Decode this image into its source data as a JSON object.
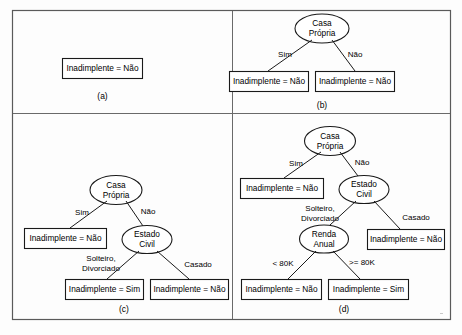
{
  "figure": {
    "caption_a": "(a)",
    "caption_b": "(b)",
    "caption_c": "(c)",
    "caption_d": "(d)",
    "colors": {
      "frame_stroke": "#5a5a5a",
      "node_stroke": "#1a1a1a",
      "node_fill": "#ffffff",
      "text": "#000000",
      "background": "#fdfdfd"
    }
  },
  "labels": {
    "inadimplente_nao": "Inadimplente = Não",
    "inadimplente_sim": "Inadimplente = Sim",
    "casa": "Casa",
    "propria": "Própria",
    "estado": "Estado",
    "civil": "Civil",
    "renda": "Renda",
    "anual": "Anual",
    "sim": "Sim",
    "nao": "Não",
    "solteiro": "Solteiro,",
    "divorciado": "Divorciado",
    "casado": "Casado",
    "lt80k": "< 80K",
    "gte80k": ">= 80K"
  },
  "panel_a": {
    "caption": "(a)",
    "nodes": [
      {
        "id": "a-leaf",
        "type": "leaf",
        "label": "Inadimplente = Não"
      }
    ],
    "edges": []
  },
  "panel_b": {
    "caption": "(b)",
    "nodes": [
      {
        "id": "b-root",
        "type": "decision",
        "label_line1": "Casa",
        "label_line2": "Própria"
      },
      {
        "id": "b-leaf-left",
        "type": "leaf",
        "label": "Inadimplente = Não"
      },
      {
        "id": "b-leaf-right",
        "type": "leaf",
        "label": "Inadimplente = Não"
      }
    ],
    "edges": [
      {
        "from": "b-root",
        "to": "b-leaf-left",
        "label": "Sim"
      },
      {
        "from": "b-root",
        "to": "b-leaf-right",
        "label": "Não"
      }
    ]
  },
  "panel_c": {
    "caption": "(c)",
    "nodes": [
      {
        "id": "c-root",
        "type": "decision",
        "label_line1": "Casa",
        "label_line2": "Própria"
      },
      {
        "id": "c-leaf-1",
        "type": "leaf",
        "label": "Inadimplente = Não"
      },
      {
        "id": "c-estado",
        "type": "decision",
        "label_line1": "Estado",
        "label_line2": "Civil"
      },
      {
        "id": "c-leaf-2",
        "type": "leaf",
        "label": "Inadimplente = Sim"
      },
      {
        "id": "c-leaf-3",
        "type": "leaf",
        "label": "Inadimplente = Não"
      }
    ],
    "edges": [
      {
        "from": "c-root",
        "to": "c-leaf-1",
        "label": "Sim"
      },
      {
        "from": "c-root",
        "to": "c-estado",
        "label": "Não"
      },
      {
        "from": "c-estado",
        "to": "c-leaf-2",
        "label_line1": "Solteiro,",
        "label_line2": "Divorciado"
      },
      {
        "from": "c-estado",
        "to": "c-leaf-3",
        "label": "Casado"
      }
    ]
  },
  "panel_d": {
    "caption": "(d)",
    "nodes": [
      {
        "id": "d-root",
        "type": "decision",
        "label_line1": "Casa",
        "label_line2": "Própria"
      },
      {
        "id": "d-leaf-1",
        "type": "leaf",
        "label": "Inadimplente = Não"
      },
      {
        "id": "d-estado",
        "type": "decision",
        "label_line1": "Estado",
        "label_line2": "Civil"
      },
      {
        "id": "d-renda",
        "type": "decision",
        "label_line1": "Renda",
        "label_line2": "Anual"
      },
      {
        "id": "d-leaf-2",
        "type": "leaf",
        "label": "Inadimplente = Não"
      },
      {
        "id": "d-leaf-3",
        "type": "leaf",
        "label": "Inadimplente = Não"
      },
      {
        "id": "d-leaf-4",
        "type": "leaf",
        "label": "Inadimplente = Sim"
      }
    ],
    "edges": [
      {
        "from": "d-root",
        "to": "d-leaf-1",
        "label": "Sim"
      },
      {
        "from": "d-root",
        "to": "d-estado",
        "label": "Não"
      },
      {
        "from": "d-estado",
        "to": "d-renda",
        "label_line1": "Solteiro,",
        "label_line2": "Divorciado"
      },
      {
        "from": "d-estado",
        "to": "d-leaf-2",
        "label": "Casado"
      },
      {
        "from": "d-renda",
        "to": "d-leaf-3",
        "label": "< 80K"
      },
      {
        "from": "d-renda",
        "to": "d-leaf-4",
        "label": ">= 80K"
      }
    ]
  }
}
